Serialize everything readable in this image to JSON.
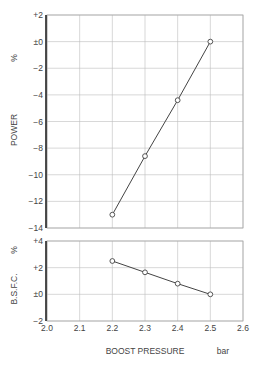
{
  "chart_data": [
    {
      "type": "line",
      "title": "",
      "xlabel": "BOOST PRESSURE",
      "xunit": "bar",
      "ylabel": "POWER",
      "yunit": "%",
      "x": [
        2.2,
        2.3,
        2.4,
        2.5
      ],
      "series": [
        {
          "name": "POWER",
          "values": [
            -13.0,
            -8.6,
            -4.4,
            0.0
          ]
        }
      ],
      "xlim": [
        2.0,
        2.6
      ],
      "ylim": [
        -14,
        2
      ],
      "xticks": [
        "2.0",
        "2.1",
        "2.2",
        "2.3",
        "2.4",
        "2.5",
        "2.6"
      ],
      "yticks": [
        "+2",
        "±0",
        "−2",
        "−4",
        "−6",
        "−8",
        "−10",
        "−12",
        "−14"
      ],
      "grid": true
    },
    {
      "type": "line",
      "title": "",
      "xlabel": "BOOST PRESSURE",
      "xunit": "bar",
      "ylabel": "B.S.F.C.",
      "yunit": "%",
      "x": [
        2.2,
        2.3,
        2.4,
        2.5
      ],
      "series": [
        {
          "name": "B.S.F.C.",
          "values": [
            2.5,
            1.65,
            0.8,
            0.0
          ]
        }
      ],
      "xlim": [
        2.0,
        2.6
      ],
      "ylim": [
        -2,
        4
      ],
      "xticks": [
        "2.0",
        "2.1",
        "2.2",
        "2.3",
        "2.4",
        "2.5",
        "2.6"
      ],
      "yticks": [
        "+4",
        "+2",
        "±0",
        "−2"
      ],
      "grid": true
    }
  ],
  "labels": {
    "power": "POWER",
    "power_unit": "%",
    "bsfc": "B.S.F.C.",
    "bsfc_unit": "%",
    "xlabel": "BOOST PRESSURE",
    "xunit": "bar"
  }
}
